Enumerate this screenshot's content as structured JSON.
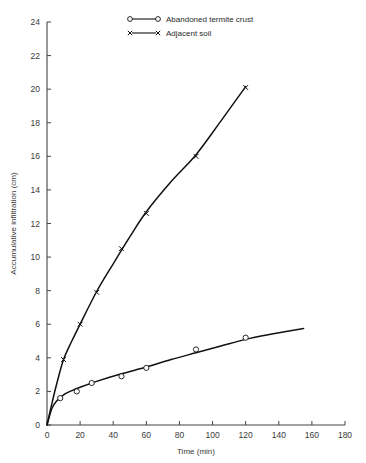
{
  "chart_data": {
    "type": "line",
    "title": "",
    "xlabel": "Time (min)",
    "ylabel": "Accumulative infiltration (cm)",
    "xlim": [
      0,
      180
    ],
    "ylim": [
      0,
      24
    ],
    "xticks": [
      0,
      20,
      40,
      60,
      80,
      100,
      120,
      140,
      160,
      180
    ],
    "yticks": [
      0,
      2,
      4,
      6,
      8,
      10,
      12,
      14,
      16,
      18,
      20,
      22,
      24
    ],
    "xtick_labels": [
      "0",
      "20",
      "40",
      "60",
      "80",
      "100",
      "120",
      "140",
      "160",
      "180"
    ],
    "ytick_labels": [
      "0",
      "2",
      "4",
      "6",
      "8",
      "10",
      "12",
      "14",
      "16",
      "18",
      "20",
      "22",
      "24"
    ],
    "grid": false,
    "legend_position": "top-center",
    "series": [
      {
        "name": "Abandoned termite crust",
        "marker": "open-circle",
        "points": [
          {
            "x": 0,
            "y": 0
          },
          {
            "x": 8,
            "y": 1.6
          },
          {
            "x": 18,
            "y": 2.0
          },
          {
            "x": 27,
            "y": 2.5
          },
          {
            "x": 45,
            "y": 2.9
          },
          {
            "x": 60,
            "y": 3.4
          },
          {
            "x": 90,
            "y": 4.5
          },
          {
            "x": 120,
            "y": 5.2
          }
        ],
        "curve": [
          {
            "x": 0,
            "y": 0
          },
          {
            "x": 3,
            "y": 1.0
          },
          {
            "x": 6,
            "y": 1.45
          },
          {
            "x": 10,
            "y": 1.8
          },
          {
            "x": 15,
            "y": 2.05
          },
          {
            "x": 20,
            "y": 2.25
          },
          {
            "x": 30,
            "y": 2.6
          },
          {
            "x": 45,
            "y": 3.05
          },
          {
            "x": 60,
            "y": 3.45
          },
          {
            "x": 75,
            "y": 3.9
          },
          {
            "x": 90,
            "y": 4.3
          },
          {
            "x": 105,
            "y": 4.7
          },
          {
            "x": 120,
            "y": 5.1
          },
          {
            "x": 135,
            "y": 5.4
          },
          {
            "x": 155,
            "y": 5.75
          }
        ]
      },
      {
        "name": "Adjacent soil",
        "marker": "cross",
        "points": [
          {
            "x": 0,
            "y": 0
          },
          {
            "x": 10,
            "y": 3.9
          },
          {
            "x": 20,
            "y": 6.0
          },
          {
            "x": 30,
            "y": 7.9
          },
          {
            "x": 45,
            "y": 10.5
          },
          {
            "x": 60,
            "y": 12.6
          },
          {
            "x": 90,
            "y": 16.0
          },
          {
            "x": 120,
            "y": 20.1
          }
        ],
        "curve": [
          {
            "x": 0,
            "y": 0
          },
          {
            "x": 3,
            "y": 1.3
          },
          {
            "x": 6,
            "y": 2.5
          },
          {
            "x": 10,
            "y": 3.9
          },
          {
            "x": 15,
            "y": 5.0
          },
          {
            "x": 20,
            "y": 6.0
          },
          {
            "x": 30,
            "y": 7.95
          },
          {
            "x": 40,
            "y": 9.6
          },
          {
            "x": 50,
            "y": 11.2
          },
          {
            "x": 60,
            "y": 12.7
          },
          {
            "x": 75,
            "y": 14.5
          },
          {
            "x": 90,
            "y": 16.1
          },
          {
            "x": 105,
            "y": 18.1
          },
          {
            "x": 120,
            "y": 20.15
          }
        ]
      }
    ]
  },
  "legend": {
    "items": [
      {
        "label": "Abandoned termite crust",
        "marker": "open-circle"
      },
      {
        "label": "Adjacent soil",
        "marker": "cross"
      }
    ]
  },
  "colors": {
    "line": "#111111",
    "axis": "#444444",
    "text": "#3a3a3a",
    "background": "#ffffff"
  }
}
